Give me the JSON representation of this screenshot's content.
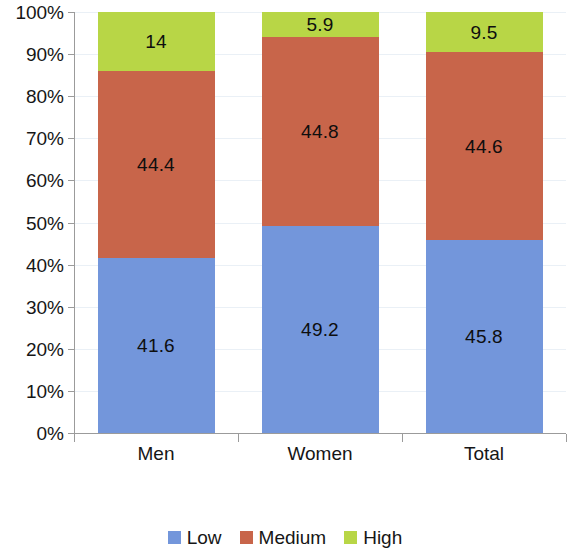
{
  "chart_data": {
    "type": "bar",
    "subtype": "stacked-percent",
    "title": "",
    "subtitle": "",
    "xlabel": "",
    "ylabel": "",
    "categories": [
      "Men",
      "Women",
      "Total"
    ],
    "series": [
      {
        "name": "Low",
        "color": "#7396DB",
        "values": [
          41.6,
          49.2,
          45.8
        ],
        "labels": [
          "41.6",
          "49.2",
          "45.8"
        ]
      },
      {
        "name": "Medium",
        "color": "#C8654A",
        "values": [
          44.4,
          44.8,
          44.6
        ],
        "labels": [
          "44.4",
          "44.8",
          "44.6"
        ]
      },
      {
        "name": "High",
        "color": "#B8D646",
        "values": [
          14.0,
          5.9,
          9.5
        ],
        "labels": [
          "14",
          "5.9",
          "9.5"
        ]
      }
    ],
    "ylim": [
      0,
      100
    ],
    "y_ticks": [
      0,
      10,
      20,
      30,
      40,
      50,
      60,
      70,
      80,
      90,
      100
    ],
    "y_tick_labels": [
      "0%",
      "10%",
      "20%",
      "30%",
      "40%",
      "50%",
      "60%",
      "70%",
      "80%",
      "90%",
      "100%"
    ],
    "grid": true,
    "grid_color": "#eaf0f6",
    "axis_color": "#9b9b9b",
    "legend_position": "bottom",
    "legend_entries": [
      "Low",
      "Medium",
      "High"
    ],
    "background": "#ffffff"
  }
}
